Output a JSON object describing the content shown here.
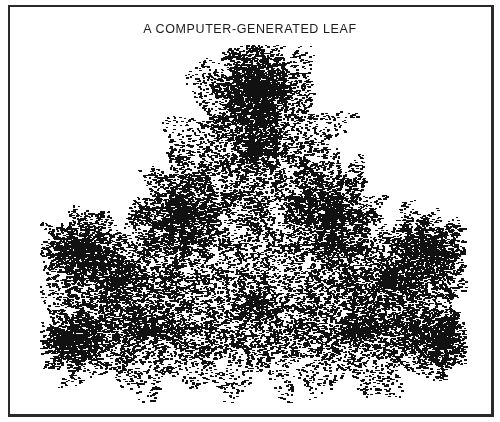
{
  "figure": {
    "title": "A COMPUTER-GENERATED LEAF",
    "ink_color": "#111111",
    "paper_color": "#ffffff",
    "border_color": "#2a2a2a"
  },
  "leaf": {
    "description": "Fractal (IFS) maple-like leaf rendered as scattered dots",
    "lobes": [
      "top",
      "upper-left",
      "upper-right",
      "lower-left",
      "lower-right"
    ],
    "bbox": {
      "x_min": 42,
      "x_max": 462,
      "y_min": 45,
      "y_max": 402
    },
    "stem_x": 255
  }
}
